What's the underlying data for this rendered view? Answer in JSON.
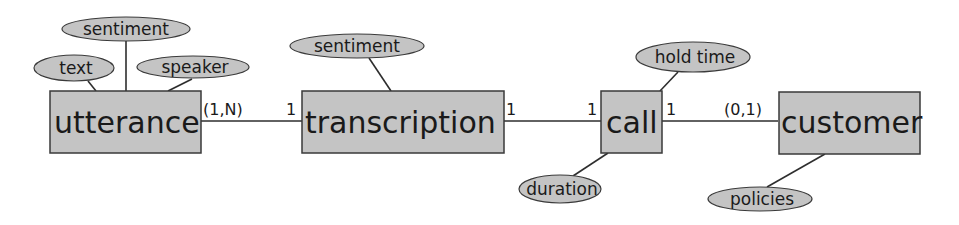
{
  "diagram": {
    "type": "entity-relationship",
    "colors": {
      "fill": "#c4c4c4",
      "stroke": "#3a3a3a",
      "background": "#ffffff"
    },
    "entities": [
      {
        "id": "utterance",
        "label": "utterance"
      },
      {
        "id": "transcription",
        "label": "transcription"
      },
      {
        "id": "call",
        "label": "call"
      },
      {
        "id": "customer",
        "label": "customer"
      }
    ],
    "attributes": [
      {
        "entity": "utterance",
        "label": "sentiment"
      },
      {
        "entity": "utterance",
        "label": "text"
      },
      {
        "entity": "utterance",
        "label": "speaker"
      },
      {
        "entity": "transcription",
        "label": "sentiment"
      },
      {
        "entity": "call",
        "label": "hold time"
      },
      {
        "entity": "call",
        "label": "duration"
      },
      {
        "entity": "customer",
        "label": "policies"
      }
    ],
    "relationships": [
      {
        "from": "utterance",
        "to": "transcription",
        "from_card": "(1,N)",
        "to_card": "1"
      },
      {
        "from": "transcription",
        "to": "call",
        "from_card": "1",
        "to_card": "1"
      },
      {
        "from": "call",
        "to": "customer",
        "from_card": "1",
        "to_card": "(0,1)"
      }
    ]
  }
}
